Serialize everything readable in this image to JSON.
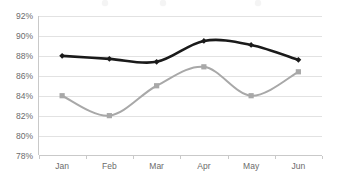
{
  "chart_data": {
    "type": "line",
    "title": "",
    "subtitle": "",
    "xlabel": "",
    "ylabel": "",
    "categories": [
      "Jan",
      "Feb",
      "Mar",
      "Apr",
      "May",
      "Jun"
    ],
    "series": [
      {
        "name": "Series 1",
        "color": "#1a1a1a",
        "marker": "diamond",
        "values": [
          88.0,
          87.7,
          87.4,
          89.5,
          89.1,
          87.6
        ]
      },
      {
        "name": "Series 2",
        "color": "#a8a8a8",
        "marker": "square",
        "values": [
          84.0,
          82.0,
          85.0,
          86.9,
          84.0,
          86.4
        ]
      }
    ],
    "ylim": [
      78,
      92
    ],
    "ytick_values": [
      78,
      80,
      82,
      84,
      86,
      88,
      90,
      92
    ],
    "ytick_labels": [
      "78%",
      "80%",
      "82%",
      "84%",
      "86%",
      "88%",
      "90%",
      "92%"
    ],
    "xtick_labels": [
      "Jan",
      "Feb",
      "Mar",
      "Apr",
      "May",
      "Jun"
    ],
    "grid": true,
    "grid_axis": "y",
    "grid_color": "#e2e2e2",
    "legend": "top",
    "legend_visible": false,
    "smoothing": true,
    "background": "#ffffff"
  },
  "axis": {
    "y_labels": [
      "92%",
      "90%",
      "88%",
      "86%",
      "84%",
      "82%",
      "80%",
      "78%"
    ],
    "x_labels": [
      "Jan",
      "Feb",
      "Mar",
      "Apr",
      "May",
      "Jun"
    ]
  }
}
